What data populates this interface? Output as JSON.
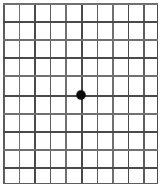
{
  "chart": {
    "name": "Amsler Grid",
    "type": "amsler-grid",
    "background_color": "#ffffff",
    "line_color": "#555555",
    "line_width_px": 1.5,
    "dot_color": "#0b0b0b",
    "dot_diameter_px": 9,
    "columns": 10,
    "rows": 10,
    "vertical_line_count": 11,
    "horizontal_line_count": 11,
    "plate": {
      "left_px": 3,
      "top_px": 3,
      "width_px": 155,
      "height_px": 181
    },
    "cell_width_px": 15.5,
    "cell_height_px": 18.1,
    "center_dot": {
      "x_px": 78,
      "y_px": 92,
      "column_index": 5,
      "row_index": 5
    },
    "vertical_line_positions_px": [
      0,
      15.5,
      31,
      46.5,
      62,
      78,
      93.5,
      109,
      124.5,
      140,
      153.5
    ],
    "horizontal_line_positions_px": [
      0,
      18.1,
      36.2,
      54.3,
      72.4,
      92,
      110.1,
      128.2,
      146.3,
      164.4,
      179.5
    ],
    "vertical_line_tones": [
      "mid",
      "light",
      "dark",
      "mid",
      "light",
      "dark",
      "mid",
      "light",
      "dark",
      "mid",
      "dark"
    ],
    "horizontal_line_tones": [
      "light",
      "dark",
      "light",
      "dark",
      "light",
      "dark",
      "light",
      "dark",
      "light",
      "dark",
      "mid"
    ]
  }
}
